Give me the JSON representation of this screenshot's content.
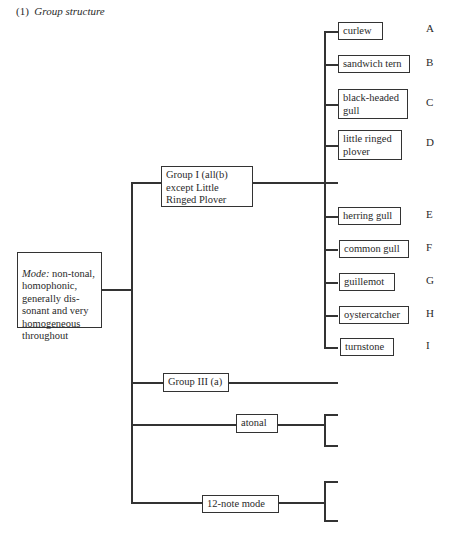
{
  "caption": {
    "number": "(1)",
    "title": "Group structure"
  },
  "root": {
    "label_italic": "Mode:",
    "label_rest": " non-tonal,\nhomophonic,\ngenerally dis-\nsonant and very\nhomogeneous\nthroughout"
  },
  "groups": [
    {
      "label": "Group I (all(b)\nexcept Little\nRinged Plover"
    },
    {
      "label": "Group III (a)"
    },
    {
      "label": "atonal"
    },
    {
      "label": "12-note mode"
    }
  ],
  "leaves": [
    {
      "label": "curlew",
      "letter": "A"
    },
    {
      "label": "sandwich tern",
      "letter": "B"
    },
    {
      "label": "black-headed\ngull",
      "letter": "C"
    },
    {
      "label": "little ringed\nplover",
      "letter": "D"
    },
    {
      "label": "herring gull",
      "letter": "E"
    },
    {
      "label": "common gull",
      "letter": "F"
    },
    {
      "label": "guillemot",
      "letter": "G"
    },
    {
      "label": "oystercatcher",
      "letter": "H"
    },
    {
      "label": "turnstone",
      "letter": "I"
    },
    {
      "label": "little tern",
      "letter": "J"
    },
    {
      "label": "redshank",
      "letter": "K"
    },
    {
      "label": "‘the waves’",
      "letter": "m"
    },
    {
      "label": "‘the foghorn’",
      "letter": "n"
    },
    {
      "label": "‘the water’",
      "letter": "o"
    },
    {
      "label": "‘nightfall\nand fog’",
      "letter": "p"
    }
  ]
}
